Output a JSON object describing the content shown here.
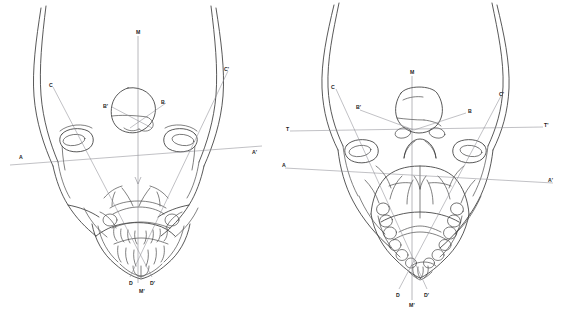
{
  "figure": {
    "background_color": "#ffffff",
    "line_color": "#3b3b3b",
    "reference_line_color": "#8e8e95",
    "panel_count": 2
  },
  "panels": [
    {
      "id": "left-panel",
      "name": "anterior-skull-view",
      "caption": "",
      "labels": [
        {
          "key": "M",
          "text": "M",
          "x": 136,
          "y": 30
        },
        {
          "key": "C",
          "text": "C",
          "x": 49,
          "y": 83
        },
        {
          "key": "Cp",
          "text": "C'",
          "x": 224,
          "y": 67
        },
        {
          "key": "Bp",
          "text": "B'",
          "x": 105,
          "y": 104
        },
        {
          "key": "B",
          "text": "B",
          "x": 160,
          "y": 100
        },
        {
          "key": "A",
          "text": "A",
          "x": 19,
          "y": 155
        },
        {
          "key": "Ap",
          "text": "A'",
          "x": 252,
          "y": 151
        },
        {
          "key": "D",
          "text": "D",
          "x": 130,
          "y": 281
        },
        {
          "key": "Mp",
          "text": "M'",
          "x": 141,
          "y": 288
        },
        {
          "key": "Dp",
          "text": "D'",
          "x": 152,
          "y": 281
        }
      ]
    },
    {
      "id": "right-panel",
      "name": "posterior-skull-view",
      "caption": "",
      "labels": [
        {
          "key": "M",
          "text": "M",
          "x": 411,
          "y": 71
        },
        {
          "key": "C",
          "text": "C",
          "x": 332,
          "y": 85
        },
        {
          "key": "Cp",
          "text": "C'",
          "x": 500,
          "y": 93
        },
        {
          "key": "Bp",
          "text": "B'",
          "x": 358,
          "y": 105
        },
        {
          "key": "B",
          "text": "B",
          "x": 466,
          "y": 110
        },
        {
          "key": "T",
          "text": "T",
          "x": 287,
          "y": 128
        },
        {
          "key": "Tp",
          "text": "T'",
          "x": 543,
          "y": 125
        },
        {
          "key": "A",
          "text": "A",
          "x": 283,
          "y": 163
        },
        {
          "key": "Ap",
          "text": "A'",
          "x": 548,
          "y": 178
        },
        {
          "key": "D",
          "text": "D",
          "x": 398,
          "y": 293
        },
        {
          "key": "Mp",
          "text": "M'",
          "x": 411,
          "y": 303
        },
        {
          "key": "Dp",
          "text": "D'",
          "x": 424,
          "y": 293
        }
      ]
    }
  ]
}
